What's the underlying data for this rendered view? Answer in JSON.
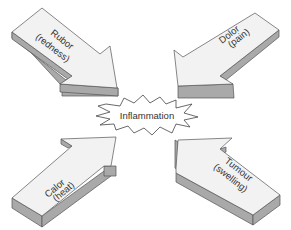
{
  "diagram": {
    "center": {
      "label": "Inflammation"
    },
    "arrows": [
      {
        "id": "rubor",
        "position": "top-left",
        "line1": "Rubor",
        "line2": "(redness)"
      },
      {
        "id": "dolor",
        "position": "top-right",
        "line1": "Dolor",
        "line2": "(pain)"
      },
      {
        "id": "calor",
        "position": "bottom-left",
        "line1": "Calor",
        "line2": "(heat)"
      },
      {
        "id": "tumour",
        "position": "bottom-right",
        "line1": "Tumour",
        "line2": "(swelling)"
      }
    ],
    "colors": {
      "arrow_face": "#f2f2f2",
      "arrow_side": "#a9a9a9",
      "outline": "#555555",
      "text": "#333333"
    }
  }
}
